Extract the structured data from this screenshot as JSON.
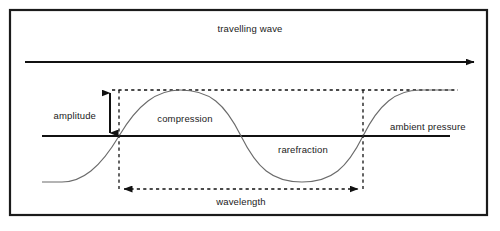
{
  "figure": {
    "title_label": "travelling wave",
    "labels": {
      "amplitude": "amplitude",
      "compression": "compression",
      "rarefraction": "rarefraction",
      "ambient_pressure": "ambient pressure",
      "wavelength": "wavelength"
    },
    "colors": {
      "frame": "#1b1b1b",
      "solid_line": "#111111",
      "wave_curve": "#6b6b6b",
      "dashed_line": "#111111",
      "text": "#1a1a1a",
      "background": "#ffffff"
    },
    "geometry": {
      "frame": {
        "x": 10,
        "y": 10,
        "width": 477,
        "height": 205
      },
      "direction_arrow": {
        "x1": 25,
        "y1": 62,
        "x2": 478,
        "y2": 62,
        "direction": "right"
      },
      "baseline": {
        "x1": 42,
        "y1": 136,
        "x2": 450,
        "y2": 136
      },
      "crest_level_y": 90,
      "trough_level_y": 182,
      "wave_start_x": 119,
      "wave_end_x": 363,
      "amplitude_arrow_x": 110,
      "wavelength_arrow_y": 189,
      "top_dashed_line": {
        "x1": 112,
        "x2": 458,
        "y": 90
      }
    }
  }
}
